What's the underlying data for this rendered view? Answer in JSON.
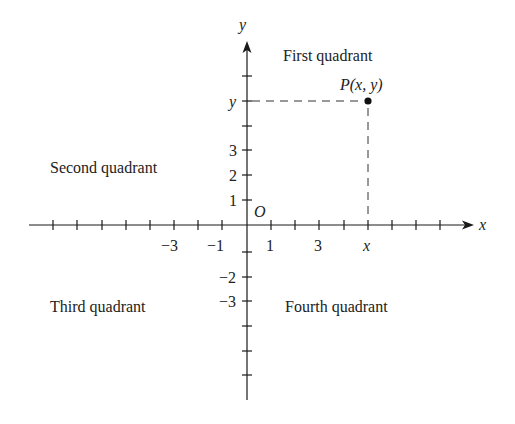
{
  "diagram": {
    "type": "cartesian-coordinate-plane",
    "axes": {
      "x_label": "x",
      "y_label": "y",
      "origin_label": "O"
    },
    "x_tick_labels": [
      {
        "value": -3,
        "text": "−3"
      },
      {
        "value": -1,
        "text": "−1"
      },
      {
        "value": 1,
        "text": "1"
      },
      {
        "value": 3,
        "text": "3"
      },
      {
        "value": "x",
        "text": "x"
      }
    ],
    "y_tick_labels": [
      {
        "value": 1,
        "text": "1"
      },
      {
        "value": 2,
        "text": "2"
      },
      {
        "value": 3,
        "text": "3"
      },
      {
        "value": "y",
        "text": "y"
      },
      {
        "value": -2,
        "text": "−2"
      },
      {
        "value": -3,
        "text": "−3"
      }
    ],
    "quadrants": {
      "first": "First quadrant",
      "second": "Second quadrant",
      "third": "Third quadrant",
      "fourth": "Fourth quadrant"
    },
    "point": {
      "label": "P(x, y)"
    },
    "colors": {
      "ink": "#1a1a1a",
      "background": "#ffffff"
    }
  }
}
